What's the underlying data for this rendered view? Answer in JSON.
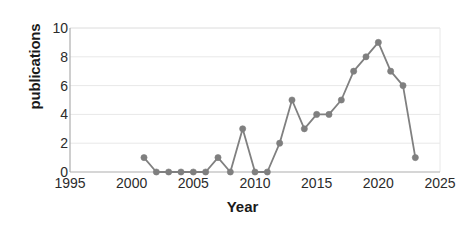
{
  "chart_data": {
    "type": "line",
    "title": "",
    "subtitle": "",
    "xlabel": "Year",
    "ylabel": "publications",
    "x": [
      2001,
      2002,
      2003,
      2004,
      2005,
      2006,
      2007,
      2008,
      2009,
      2010,
      2011,
      2012,
      2013,
      2014,
      2015,
      2016,
      2017,
      2018,
      2019,
      2020,
      2021,
      2022,
      2023
    ],
    "values": [
      1,
      0,
      0,
      0,
      0,
      0,
      1,
      0,
      3,
      0,
      0,
      2,
      5,
      3,
      4,
      4,
      5,
      7,
      8,
      9,
      7,
      6,
      1
    ],
    "series": [
      {
        "name": "publications",
        "values": [
          1,
          0,
          0,
          0,
          0,
          0,
          1,
          0,
          3,
          0,
          0,
          2,
          5,
          3,
          4,
          4,
          5,
          7,
          8,
          9,
          7,
          6,
          1
        ]
      }
    ],
    "xlim": [
      1995,
      2025
    ],
    "ylim": [
      0,
      10
    ],
    "xticks": [
      1995,
      2000,
      2005,
      2010,
      2015,
      2020,
      2025
    ],
    "yticks": [
      0,
      2,
      4,
      6,
      8,
      10
    ],
    "xtick_labels": [
      "1995",
      "2000",
      "2005",
      "2010",
      "2015",
      "2020",
      "2025"
    ],
    "ytick_labels": [
      "0",
      "2",
      "4",
      "6",
      "8",
      "10"
    ],
    "grid": "horizontal",
    "legend": "none",
    "marker": "circle",
    "colors": {
      "line": "#808080",
      "marker": "#7f7f7f",
      "grid": "#e8e8e8",
      "axis": "#aeaeae",
      "text": "#2b2b2b",
      "background": "#ffffff"
    }
  },
  "axes": {
    "y_title": "publications",
    "x_title": "Year"
  }
}
